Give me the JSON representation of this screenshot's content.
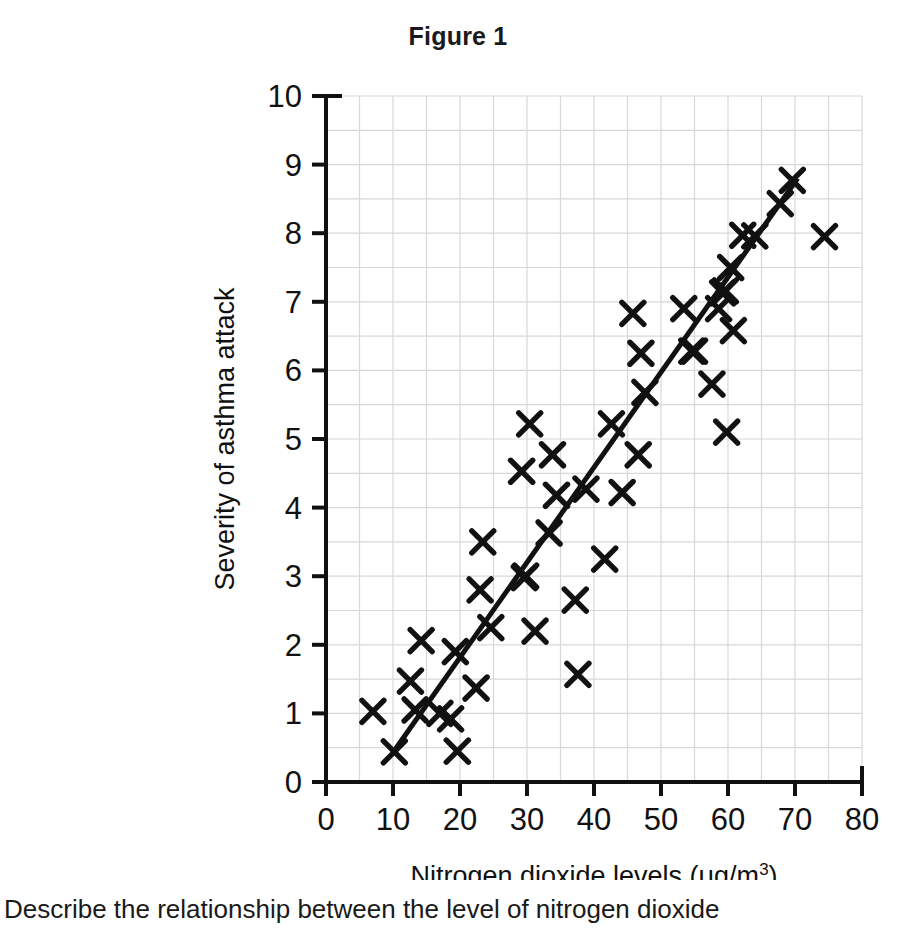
{
  "figure": {
    "title": "Figure 1"
  },
  "prompt": {
    "text": "Describe the relationship between the level of nitrogen dioxide"
  },
  "axes": {
    "x_title_main": "Nitrogen dioxide levels (μg/m",
    "x_title_sup": "3",
    "x_title_close": ")",
    "y_title": "Severity of asthma attack",
    "x_ticks": [
      "0",
      "10",
      "20",
      "30",
      "40",
      "50",
      "60",
      "70",
      "80"
    ],
    "y_ticks": [
      "0",
      "1",
      "2",
      "3",
      "4",
      "5",
      "6",
      "7",
      "8",
      "9",
      "10"
    ]
  },
  "colors": {
    "ink": "#111111",
    "grid": "#d8d8d8",
    "marker": "#111111",
    "trendline": "#111111",
    "background": "#ffffff"
  },
  "chart_data": {
    "type": "scatter",
    "title": "Figure 1",
    "xlabel": "Nitrogen dioxide levels (μg/m3)",
    "ylabel": "Severity of asthma attack",
    "xlim": [
      0,
      80
    ],
    "ylim": [
      0,
      10
    ],
    "xticks": [
      0,
      10,
      20,
      30,
      40,
      50,
      60,
      70,
      80
    ],
    "yticks": [
      0,
      1,
      2,
      3,
      4,
      5,
      6,
      7,
      8,
      9,
      10
    ],
    "grid": true,
    "grid_x_step": 5,
    "grid_y_step": 0.5,
    "legend": null,
    "marker": "x",
    "points": [
      [
        7.0,
        1.03
      ],
      [
        10.2,
        0.44
      ],
      [
        12.6,
        1.47
      ],
      [
        13.3,
        1.05
      ],
      [
        14.2,
        2.06
      ],
      [
        17.0,
        1.0
      ],
      [
        18.6,
        0.92
      ],
      [
        19.3,
        1.9
      ],
      [
        19.6,
        0.45
      ],
      [
        22.4,
        1.37
      ],
      [
        23.0,
        2.8
      ],
      [
        23.4,
        3.5
      ],
      [
        24.6,
        2.25
      ],
      [
        29.2,
        4.53
      ],
      [
        29.6,
        2.98
      ],
      [
        29.8,
        3.0
      ],
      [
        30.4,
        5.22
      ],
      [
        31.2,
        2.2
      ],
      [
        33.3,
        3.63
      ],
      [
        33.8,
        4.77
      ],
      [
        34.4,
        4.18
      ],
      [
        37.2,
        2.65
      ],
      [
        37.6,
        1.57
      ],
      [
        38.8,
        4.27
      ],
      [
        41.6,
        3.25
      ],
      [
        42.6,
        5.22
      ],
      [
        44.2,
        4.22
      ],
      [
        45.8,
        6.83
      ],
      [
        46.6,
        4.77
      ],
      [
        47.0,
        6.25
      ],
      [
        47.6,
        5.68
      ],
      [
        53.4,
        6.9
      ],
      [
        54.6,
        6.28
      ],
      [
        55.0,
        6.28
      ],
      [
        57.6,
        5.8
      ],
      [
        58.6,
        6.9
      ],
      [
        59.2,
        7.13
      ],
      [
        59.6,
        7.16
      ],
      [
        59.8,
        5.1
      ],
      [
        60.4,
        7.5
      ],
      [
        60.8,
        6.58
      ],
      [
        62.2,
        7.97
      ],
      [
        64.0,
        7.96
      ],
      [
        67.8,
        8.43
      ],
      [
        69.6,
        8.77
      ],
      [
        74.4,
        7.95
      ]
    ],
    "trendline": {
      "type": "linear",
      "x_start": 10.0,
      "y_start": 0.43,
      "x_end": 70.4,
      "y_end": 8.8
    }
  }
}
